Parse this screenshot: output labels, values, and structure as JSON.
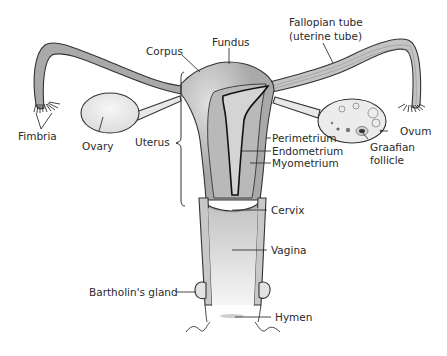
{
  "diagram": {
    "type": "anatomical-illustration",
    "colors": {
      "tissue": "#a9a9a9",
      "tissue_light": "#c8c8c8",
      "ovary": "#e6e6e6",
      "vagina_top": "#c9c9c9",
      "vagina_bottom": "#f4f4f4",
      "outline": "#333333",
      "background": "#ffffff"
    },
    "labels": {
      "fallopian_tube_line1": "Fallopian tube",
      "fallopian_tube_line2": "(uterine tube)",
      "fundus": "Fundus",
      "corpus": "Corpus",
      "fimbria": "Fimbria",
      "ovary": "Ovary",
      "uterus": "Uterus",
      "perimetrium": "Perimetrium",
      "endometrium": "Endometrium",
      "myometrium": "Myometrium",
      "ovum": "Ovum",
      "graafian_follicle_line1": "Graafian",
      "graafian_follicle_line2": "follicle",
      "cervix": "Cervix",
      "vagina": "Vagina",
      "bartholins_gland": "Bartholin's gland",
      "hymen": "Hymen"
    }
  }
}
